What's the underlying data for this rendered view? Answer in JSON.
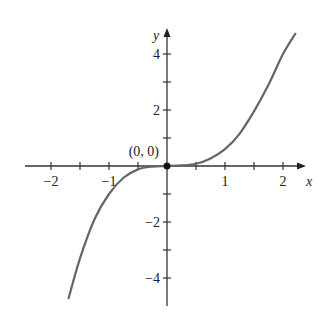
{
  "chart_data": {
    "type": "line",
    "title": "",
    "xlabel": "x",
    "ylabel": "y",
    "xlim": [
      -2.4,
      2.5
    ],
    "ylim": [
      -5,
      5
    ],
    "grid": false,
    "x_ticks": [
      -2,
      -1.5,
      -1,
      -0.5,
      0,
      0.5,
      1,
      1.5,
      2
    ],
    "x_tick_labels": [
      "−2",
      "−1",
      "1",
      "2"
    ],
    "x_tick_label_values": [
      -2,
      -1,
      1,
      2
    ],
    "y_ticks": [
      -4,
      -3,
      -2,
      -1,
      1,
      2,
      3,
      4
    ],
    "y_tick_labels": [
      "4",
      "2",
      "−2",
      "−4"
    ],
    "y_tick_label_values": [
      4,
      2,
      -2,
      -4
    ],
    "series": [
      {
        "name": "curve",
        "x": [
          -1.7,
          -1.5,
          -1.25,
          -1.0,
          -0.75,
          -0.5,
          -0.25,
          0,
          0.25,
          0.5,
          0.75,
          1.0,
          1.25,
          1.5,
          1.75,
          2.0,
          2.22
        ],
        "y": [
          -4.75,
          -3.3,
          -1.9,
          -1.0,
          -0.42,
          -0.12,
          -0.02,
          0,
          0.02,
          0.08,
          0.27,
          0.6,
          1.15,
          1.95,
          2.9,
          4.0,
          4.75
        ]
      }
    ],
    "annotations": [
      {
        "text": "(0, 0)",
        "x": 0,
        "y": 0,
        "marker": "filled-dot"
      }
    ]
  }
}
